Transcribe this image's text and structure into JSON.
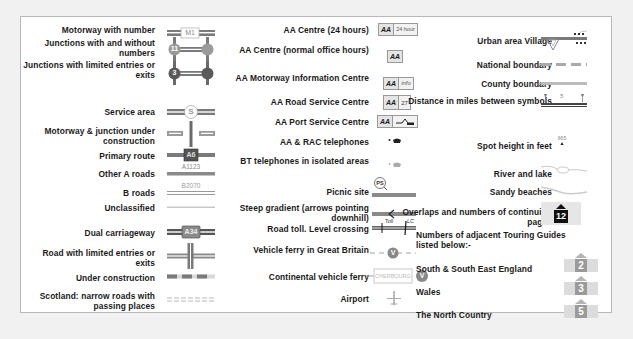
{
  "legend": {
    "colors": {
      "motorway": "#7a7a7a",
      "primary": "#6e6e6e",
      "a_road": "#8a8a8a",
      "b_road": "#9a9a9a",
      "minor": "#c8c8c8",
      "panel_border": "#b8b8b8",
      "background": "#f1f1f1",
      "guide_box": "#c9c9c9"
    },
    "column1": [
      {
        "label": "Motorway with number",
        "symbol": "motorway-number",
        "text": "M1"
      },
      {
        "label": "Junctions with and without numbers",
        "symbol": "junctions-numbered",
        "text": "11"
      },
      {
        "label": "Junctions with limited entries or exits",
        "symbol": "junctions-limited",
        "text": "3"
      },
      {
        "label": "Service area",
        "symbol": "service-area",
        "text": "S"
      },
      {
        "label": "Motorway & junction under construction",
        "symbol": "motorway-construction"
      },
      {
        "label": "Primary route",
        "symbol": "primary-route",
        "text": "A6"
      },
      {
        "label": "Other A roads",
        "symbol": "a-road",
        "text": "A1123"
      },
      {
        "label": "B roads",
        "symbol": "b-road",
        "text": "B2070"
      },
      {
        "label": "Unclassified",
        "symbol": "unclassified"
      },
      {
        "label": "Dual carriageway",
        "symbol": "dual-carriageway",
        "text": "A34"
      },
      {
        "label": "Road with limited entries or exits",
        "symbol": "road-limited"
      },
      {
        "label": "Under construction",
        "symbol": "under-construction"
      },
      {
        "label": "Scotland: narrow roads with passing places",
        "symbol": "narrow-roads"
      }
    ],
    "column2": [
      {
        "label": "AA Centre (24 hours)",
        "symbol": "aa-24",
        "text": "AA",
        "extra": "24 hour"
      },
      {
        "label": "AA Centre (normal office hours)",
        "symbol": "aa-office",
        "text": "AA"
      },
      {
        "label": "AA Motorway Information Centre",
        "symbol": "aa-info",
        "text": "AA",
        "extra": "info"
      },
      {
        "label": "AA Road Service Centre",
        "symbol": "aa-road-service",
        "text": "AA",
        "extra": "27"
      },
      {
        "label": "AA Port Service Centre",
        "symbol": "aa-port",
        "text": "AA"
      },
      {
        "label": "AA & RAC telephones",
        "symbol": "aa-telephone"
      },
      {
        "label": "BT telephones in isolated areas",
        "symbol": "bt-telephone"
      },
      {
        "label": "Picnic site",
        "symbol": "picnic-site",
        "text": "PS"
      },
      {
        "label": "Steep gradient (arrows pointing downhill)",
        "symbol": "steep-gradient"
      },
      {
        "label": "Road toll. Level crossing",
        "symbol": "toll-crossing",
        "text": "Toll",
        "extra": "LC"
      },
      {
        "label": "Vehicle ferry in Great Britain",
        "symbol": "vehicle-ferry",
        "text": "V"
      },
      {
        "label": "Continental vehicle ferry",
        "symbol": "continental-ferry",
        "text": "CHERBOURG",
        "extra": "V"
      },
      {
        "label": "Airport",
        "symbol": "airport"
      }
    ],
    "column3": [
      {
        "label": "Urban area Village",
        "symbol": "urban-village"
      },
      {
        "label": "National boundary",
        "symbol": "national-boundary"
      },
      {
        "label": "County boundary",
        "symbol": "county-boundary"
      },
      {
        "label": "Distance in miles between symbols",
        "symbol": "distance",
        "text": "5"
      },
      {
        "label": "Spot height in feet",
        "symbol": "spot-height",
        "text": "665"
      },
      {
        "label": "River and lake",
        "symbol": "river-lake"
      },
      {
        "label": "Sandy beaches",
        "symbol": "sandy-beaches"
      },
      {
        "label": "Overlaps and numbers of continuing pages",
        "symbol": "page-overlap",
        "text": "12"
      }
    ],
    "guides_heading": "Numbers of adjacent Touring Guides listed below:-",
    "guides": [
      {
        "label": "South & South East England",
        "number": "2"
      },
      {
        "label": "Wales",
        "number": "3"
      },
      {
        "label": "The North Country",
        "number": "5"
      }
    ]
  }
}
